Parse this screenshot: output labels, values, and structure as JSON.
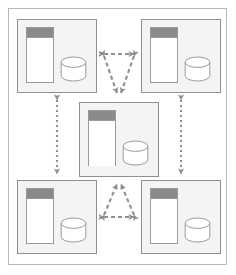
{
  "diagram": {
    "frame_label": "diagram-frame",
    "colors": {
      "frame_border": "#b9b9b9",
      "node_border": "#8f8f8f",
      "node_fill": "#f4f4f4",
      "window_border": "#9a9a9a",
      "window_fill": "#ffffff",
      "titlebar_fill": "#8a8a8a",
      "cylinder_stroke": "#9a9a9a",
      "cylinder_fill": "#ffffff",
      "connector": "#8f8f8f",
      "page_background": "#ffffff"
    },
    "nodes": [
      {
        "id": "node-top-left",
        "label": "",
        "position": "top-left",
        "x": 17,
        "y": 19,
        "width": 80,
        "height": 74,
        "components": [
          {
            "type": "application-window",
            "label": "",
            "icon": "window-icon"
          },
          {
            "type": "database",
            "label": "",
            "icon": "database-cylinder-icon"
          }
        ]
      },
      {
        "id": "node-top-right",
        "label": "",
        "position": "top-right",
        "x": 141,
        "y": 19,
        "width": 80,
        "height": 74,
        "components": [
          {
            "type": "application-window",
            "label": "",
            "icon": "window-icon"
          },
          {
            "type": "database",
            "label": "",
            "icon": "database-cylinder-icon"
          }
        ]
      },
      {
        "id": "node-center",
        "label": "",
        "position": "center",
        "x": 79,
        "y": 102,
        "width": 80,
        "height": 75,
        "components": [
          {
            "type": "application-window",
            "label": "",
            "icon": "window-icon"
          },
          {
            "type": "database",
            "label": "",
            "icon": "database-cylinder-icon"
          }
        ]
      },
      {
        "id": "node-bottom-left",
        "label": "",
        "position": "bottom-left",
        "x": 17,
        "y": 180,
        "width": 80,
        "height": 74,
        "components": [
          {
            "type": "application-window",
            "label": "",
            "icon": "window-icon"
          },
          {
            "type": "database",
            "label": "",
            "icon": "database-cylinder-icon"
          }
        ]
      },
      {
        "id": "node-bottom-right",
        "label": "",
        "position": "bottom-right",
        "x": 141,
        "y": 180,
        "width": 80,
        "height": 74,
        "components": [
          {
            "type": "application-window",
            "label": "",
            "icon": "window-icon"
          },
          {
            "type": "database",
            "label": "",
            "icon": "database-cylinder-icon"
          }
        ]
      }
    ],
    "connectors": [
      {
        "id": "link-tl-tr",
        "from": "node-top-left",
        "to": "node-top-right",
        "style": "dashed",
        "arrows": "both",
        "label": ""
      },
      {
        "id": "link-tl-center",
        "from": "node-top-left",
        "to": "node-center",
        "style": "dashed",
        "arrows": "both",
        "label": ""
      },
      {
        "id": "link-tr-center",
        "from": "node-top-right",
        "to": "node-center",
        "style": "dashed",
        "arrows": "both",
        "label": ""
      },
      {
        "id": "link-bl-br",
        "from": "node-bottom-left",
        "to": "node-bottom-right",
        "style": "dashed",
        "arrows": "both",
        "label": ""
      },
      {
        "id": "link-bl-center",
        "from": "node-bottom-left",
        "to": "node-center",
        "style": "dashed",
        "arrows": "both",
        "label": ""
      },
      {
        "id": "link-br-center",
        "from": "node-bottom-right",
        "to": "node-center",
        "style": "dashed",
        "arrows": "both",
        "label": ""
      },
      {
        "id": "link-tl-bl",
        "from": "node-top-left",
        "to": "node-bottom-left",
        "style": "dotted",
        "arrows": "both",
        "label": ""
      },
      {
        "id": "link-tr-br",
        "from": "node-top-right",
        "to": "node-bottom-right",
        "style": "dotted",
        "arrows": "both",
        "label": ""
      }
    ]
  }
}
